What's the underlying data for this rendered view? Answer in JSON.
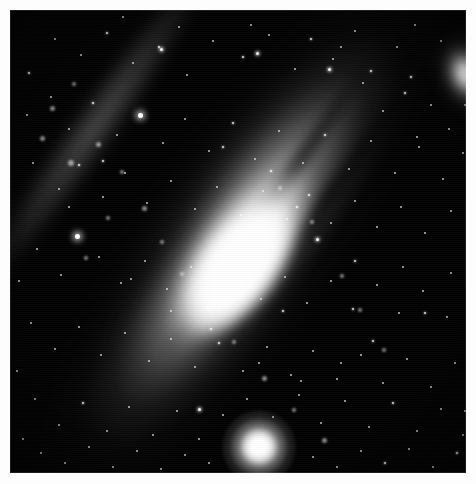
{
  "image": {
    "kind": "astrophotograph",
    "subject": "Andromeda Galaxy (M31)",
    "palette": "grayscale",
    "frame": {
      "border_color": "#fdfdfd",
      "border_width_px": 10
    },
    "plate": {
      "background_color": "#020202",
      "width_px": 456,
      "height_px": 463
    }
  },
  "objects": {
    "main_galaxy": {
      "name": "spiral-galaxy-m31",
      "core_color": "#ffffff",
      "disk_color": "#b4b4b4",
      "position_angle_deg": -55,
      "core_center": {
        "x": 229,
        "y": 259
      }
    },
    "companion_galaxy": {
      "name": "elliptical-companion-m110",
      "core_color": "#ffffff",
      "center": {
        "x": 456,
        "y": 64
      }
    },
    "bright_star": {
      "name": "foreground-bright-star",
      "color": "#ffffff",
      "center": {
        "x": 249,
        "y": 437
      }
    }
  },
  "features": {
    "dust_lanes": [
      {
        "name": "dust-lane-ne-outer",
        "opacity": 0.8
      },
      {
        "name": "dust-lane-ne-mid",
        "opacity": 0.74
      },
      {
        "name": "dust-lane-ne-inner",
        "opacity": 0.7
      },
      {
        "name": "dust-lane-sw-inner",
        "opacity": 0.45
      },
      {
        "name": "dust-lane-sw-outer",
        "opacity": 0.38
      }
    ],
    "spiral_arm": {
      "name": "spiral-arm-nw",
      "opacity": 0.4
    }
  },
  "stars": [
    {
      "x": 18,
      "y": 62,
      "s": 3
    },
    {
      "x": 44,
      "y": 28,
      "s": 2
    },
    {
      "x": 70,
      "y": 44,
      "s": 2
    },
    {
      "x": 96,
      "y": 22,
      "s": 3
    },
    {
      "x": 122,
      "y": 52,
      "s": 2
    },
    {
      "x": 148,
      "y": 36,
      "s": 3
    },
    {
      "x": 150,
      "y": 38,
      "s": 4
    },
    {
      "x": 176,
      "y": 64,
      "s": 2
    },
    {
      "x": 202,
      "y": 30,
      "s": 2
    },
    {
      "x": 232,
      "y": 46,
      "s": 3
    },
    {
      "x": 258,
      "y": 24,
      "s": 2
    },
    {
      "x": 246,
      "y": 42,
      "s": 4
    },
    {
      "x": 284,
      "y": 58,
      "s": 2
    },
    {
      "x": 300,
      "y": 28,
      "s": 3
    },
    {
      "x": 322,
      "y": 48,
      "s": 2
    },
    {
      "x": 344,
      "y": 20,
      "s": 2
    },
    {
      "x": 360,
      "y": 60,
      "s": 3
    },
    {
      "x": 318,
      "y": 58,
      "s": 4
    },
    {
      "x": 386,
      "y": 36,
      "s": 2
    },
    {
      "x": 330,
      "y": 36,
      "s": 2
    },
    {
      "x": 352,
      "y": 72,
      "s": 2
    },
    {
      "x": 400,
      "y": 66,
      "s": 3
    },
    {
      "x": 420,
      "y": 94,
      "s": 2
    },
    {
      "x": 438,
      "y": 118,
      "s": 2
    },
    {
      "x": 406,
      "y": 126,
      "s": 2
    },
    {
      "x": 372,
      "y": 100,
      "s": 2
    },
    {
      "x": 394,
      "y": 82,
      "s": 3
    },
    {
      "x": 16,
      "y": 104,
      "s": 2
    },
    {
      "x": 40,
      "y": 86,
      "s": 2
    },
    {
      "x": 58,
      "y": 118,
      "s": 2
    },
    {
      "x": 82,
      "y": 92,
      "s": 3
    },
    {
      "x": 106,
      "y": 124,
      "s": 2
    },
    {
      "x": 128,
      "y": 103,
      "s": 5
    },
    {
      "x": 152,
      "y": 132,
      "s": 2
    },
    {
      "x": 174,
      "y": 108,
      "s": 2
    },
    {
      "x": 198,
      "y": 140,
      "s": 2
    },
    {
      "x": 222,
      "y": 112,
      "s": 3
    },
    {
      "x": 244,
      "y": 148,
      "s": 2
    },
    {
      "x": 268,
      "y": 120,
      "s": 2
    },
    {
      "x": 292,
      "y": 152,
      "s": 2
    },
    {
      "x": 314,
      "y": 124,
      "s": 3
    },
    {
      "x": 338,
      "y": 158,
      "s": 2
    },
    {
      "x": 360,
      "y": 130,
      "s": 2
    },
    {
      "x": 384,
      "y": 162,
      "s": 2
    },
    {
      "x": 408,
      "y": 136,
      "s": 2
    },
    {
      "x": 432,
      "y": 168,
      "s": 2
    },
    {
      "x": 452,
      "y": 142,
      "s": 2
    },
    {
      "x": 22,
      "y": 152,
      "s": 2
    },
    {
      "x": 48,
      "y": 178,
      "s": 2
    },
    {
      "x": 68,
      "y": 154,
      "s": 3
    },
    {
      "x": 92,
      "y": 186,
      "s": 2
    },
    {
      "x": 114,
      "y": 162,
      "s": 2
    },
    {
      "x": 136,
      "y": 192,
      "s": 2
    },
    {
      "x": 160,
      "y": 170,
      "s": 2
    },
    {
      "x": 184,
      "y": 198,
      "s": 2
    },
    {
      "x": 206,
      "y": 176,
      "s": 2
    },
    {
      "x": 230,
      "y": 204,
      "s": 2
    },
    {
      "x": 252,
      "y": 180,
      "s": 2
    },
    {
      "x": 276,
      "y": 208,
      "s": 2
    },
    {
      "x": 298,
      "y": 184,
      "s": 3
    },
    {
      "x": 320,
      "y": 212,
      "s": 2
    },
    {
      "x": 344,
      "y": 190,
      "s": 2
    },
    {
      "x": 366,
      "y": 216,
      "s": 2
    },
    {
      "x": 390,
      "y": 196,
      "s": 2
    },
    {
      "x": 414,
      "y": 222,
      "s": 2
    },
    {
      "x": 440,
      "y": 200,
      "s": 2
    },
    {
      "x": 458,
      "y": 230,
      "s": 3
    },
    {
      "x": 65,
      "y": 224,
      "s": 5
    },
    {
      "x": 26,
      "y": 238,
      "s": 2
    },
    {
      "x": 50,
      "y": 264,
      "s": 2
    },
    {
      "x": 88,
      "y": 246,
      "s": 2
    },
    {
      "x": 110,
      "y": 272,
      "s": 2
    },
    {
      "x": 134,
      "y": 250,
      "s": 2
    },
    {
      "x": 156,
      "y": 278,
      "s": 2
    },
    {
      "x": 180,
      "y": 256,
      "s": 2
    },
    {
      "x": 204,
      "y": 284,
      "s": 2
    },
    {
      "x": 228,
      "y": 260,
      "s": 2
    },
    {
      "x": 250,
      "y": 288,
      "s": 2
    },
    {
      "x": 274,
      "y": 266,
      "s": 2
    },
    {
      "x": 296,
      "y": 292,
      "s": 2
    },
    {
      "x": 320,
      "y": 270,
      "s": 2
    },
    {
      "x": 342,
      "y": 298,
      "s": 3
    },
    {
      "x": 366,
      "y": 274,
      "s": 2
    },
    {
      "x": 388,
      "y": 302,
      "s": 2
    },
    {
      "x": 412,
      "y": 280,
      "s": 2
    },
    {
      "x": 436,
      "y": 306,
      "s": 2
    },
    {
      "x": 456,
      "y": 284,
      "s": 2
    },
    {
      "x": 20,
      "y": 312,
      "s": 2
    },
    {
      "x": 44,
      "y": 338,
      "s": 2
    },
    {
      "x": 68,
      "y": 316,
      "s": 2
    },
    {
      "x": 90,
      "y": 344,
      "s": 2
    },
    {
      "x": 114,
      "y": 322,
      "s": 2
    },
    {
      "x": 138,
      "y": 350,
      "s": 2
    },
    {
      "x": 160,
      "y": 328,
      "s": 2
    },
    {
      "x": 184,
      "y": 356,
      "s": 2
    },
    {
      "x": 208,
      "y": 332,
      "s": 3
    },
    {
      "x": 232,
      "y": 360,
      "s": 2
    },
    {
      "x": 256,
      "y": 336,
      "s": 2
    },
    {
      "x": 280,
      "y": 364,
      "s": 2
    },
    {
      "x": 302,
      "y": 340,
      "s": 2
    },
    {
      "x": 326,
      "y": 368,
      "s": 2
    },
    {
      "x": 350,
      "y": 344,
      "s": 2
    },
    {
      "x": 372,
      "y": 372,
      "s": 2
    },
    {
      "x": 396,
      "y": 348,
      "s": 2
    },
    {
      "x": 420,
      "y": 376,
      "s": 2
    },
    {
      "x": 444,
      "y": 352,
      "s": 2
    },
    {
      "x": 24,
      "y": 388,
      "s": 2
    },
    {
      "x": 48,
      "y": 414,
      "s": 2
    },
    {
      "x": 72,
      "y": 392,
      "s": 3
    },
    {
      "x": 96,
      "y": 420,
      "s": 2
    },
    {
      "x": 118,
      "y": 396,
      "s": 2
    },
    {
      "x": 142,
      "y": 424,
      "s": 2
    },
    {
      "x": 166,
      "y": 400,
      "s": 2
    },
    {
      "x": 188,
      "y": 428,
      "s": 2
    },
    {
      "x": 188,
      "y": 398,
      "s": 4
    },
    {
      "x": 212,
      "y": 404,
      "s": 2
    },
    {
      "x": 236,
      "y": 388,
      "s": 2
    },
    {
      "x": 262,
      "y": 406,
      "s": 2
    },
    {
      "x": 288,
      "y": 384,
      "s": 2
    },
    {
      "x": 310,
      "y": 412,
      "s": 2
    },
    {
      "x": 334,
      "y": 390,
      "s": 2
    },
    {
      "x": 358,
      "y": 416,
      "s": 2
    },
    {
      "x": 382,
      "y": 392,
      "s": 3
    },
    {
      "x": 406,
      "y": 420,
      "s": 2
    },
    {
      "x": 430,
      "y": 398,
      "s": 2
    },
    {
      "x": 452,
      "y": 424,
      "s": 2
    },
    {
      "x": 30,
      "y": 442,
      "s": 2
    },
    {
      "x": 54,
      "y": 452,
      "s": 2
    },
    {
      "x": 78,
      "y": 436,
      "s": 2
    },
    {
      "x": 102,
      "y": 456,
      "s": 2
    },
    {
      "x": 126,
      "y": 440,
      "s": 2
    },
    {
      "x": 150,
      "y": 458,
      "s": 2
    },
    {
      "x": 174,
      "y": 444,
      "s": 2
    },
    {
      "x": 198,
      "y": 452,
      "s": 2
    },
    {
      "x": 302,
      "y": 446,
      "s": 2
    },
    {
      "x": 326,
      "y": 456,
      "s": 2
    },
    {
      "x": 350,
      "y": 440,
      "s": 2
    },
    {
      "x": 374,
      "y": 452,
      "s": 3
    },
    {
      "x": 398,
      "y": 438,
      "s": 2
    },
    {
      "x": 422,
      "y": 456,
      "s": 2
    },
    {
      "x": 446,
      "y": 442,
      "s": 3
    },
    {
      "x": 272,
      "y": 300,
      "s": 3
    },
    {
      "x": 200,
      "y": 318,
      "s": 3
    },
    {
      "x": 160,
      "y": 300,
      "s": 2
    },
    {
      "x": 120,
      "y": 268,
      "s": 2
    },
    {
      "x": 306,
      "y": 228,
      "s": 4
    },
    {
      "x": 344,
      "y": 250,
      "s": 3
    },
    {
      "x": 260,
      "y": 160,
      "s": 3
    },
    {
      "x": 286,
      "y": 196,
      "s": 3
    },
    {
      "x": 212,
      "y": 136,
      "s": 3
    },
    {
      "x": 92,
      "y": 150,
      "s": 3
    },
    {
      "x": 58,
      "y": 196,
      "s": 2
    },
    {
      "x": 392,
      "y": 256,
      "s": 2
    },
    {
      "x": 414,
      "y": 302,
      "s": 3
    },
    {
      "x": 440,
      "y": 262,
      "s": 2
    },
    {
      "x": 362,
      "y": 330,
      "s": 3
    },
    {
      "x": 330,
      "y": 352,
      "s": 2
    },
    {
      "x": 290,
      "y": 370,
      "s": 2
    },
    {
      "x": 248,
      "y": 352,
      "s": 2
    },
    {
      "x": 454,
      "y": 94,
      "s": 2
    },
    {
      "x": 430,
      "y": 30,
      "s": 2
    },
    {
      "x": 404,
      "y": 14,
      "s": 2
    },
    {
      "x": 464,
      "y": 186,
      "s": 3
    },
    {
      "x": 466,
      "y": 342,
      "s": 2
    },
    {
      "x": 454,
      "y": 400,
      "s": 2
    },
    {
      "x": 8,
      "y": 270,
      "s": 2
    },
    {
      "x": 6,
      "y": 360,
      "s": 2
    },
    {
      "x": 12,
      "y": 428,
      "s": 2
    },
    {
      "x": 240,
      "y": 14,
      "s": 2
    },
    {
      "x": 168,
      "y": 16,
      "s": 2
    },
    {
      "x": 112,
      "y": 6,
      "s": 2
    }
  ],
  "knots": [
    {
      "x": 40,
      "y": 96,
      "d": 5
    },
    {
      "x": 62,
      "y": 72,
      "d": 4
    },
    {
      "x": 86,
      "y": 132,
      "d": 5
    },
    {
      "x": 110,
      "y": 160,
      "d": 4
    },
    {
      "x": 132,
      "y": 196,
      "d": 5
    },
    {
      "x": 58,
      "y": 150,
      "d": 6
    },
    {
      "x": 30,
      "y": 126,
      "d": 5
    },
    {
      "x": 150,
      "y": 230,
      "d": 4
    },
    {
      "x": 170,
      "y": 262,
      "d": 4
    },
    {
      "x": 196,
      "y": 296,
      "d": 5
    },
    {
      "x": 222,
      "y": 330,
      "d": 4
    },
    {
      "x": 252,
      "y": 366,
      "d": 5
    },
    {
      "x": 282,
      "y": 398,
      "d": 4
    },
    {
      "x": 312,
      "y": 428,
      "d": 5
    },
    {
      "x": 96,
      "y": 206,
      "d": 4
    },
    {
      "x": 74,
      "y": 246,
      "d": 4
    },
    {
      "x": 348,
      "y": 298,
      "d": 4
    },
    {
      "x": 372,
      "y": 338,
      "d": 4
    },
    {
      "x": 330,
      "y": 264,
      "d": 4
    },
    {
      "x": 300,
      "y": 210,
      "d": 4
    },
    {
      "x": 268,
      "y": 176,
      "d": 4
    }
  ]
}
